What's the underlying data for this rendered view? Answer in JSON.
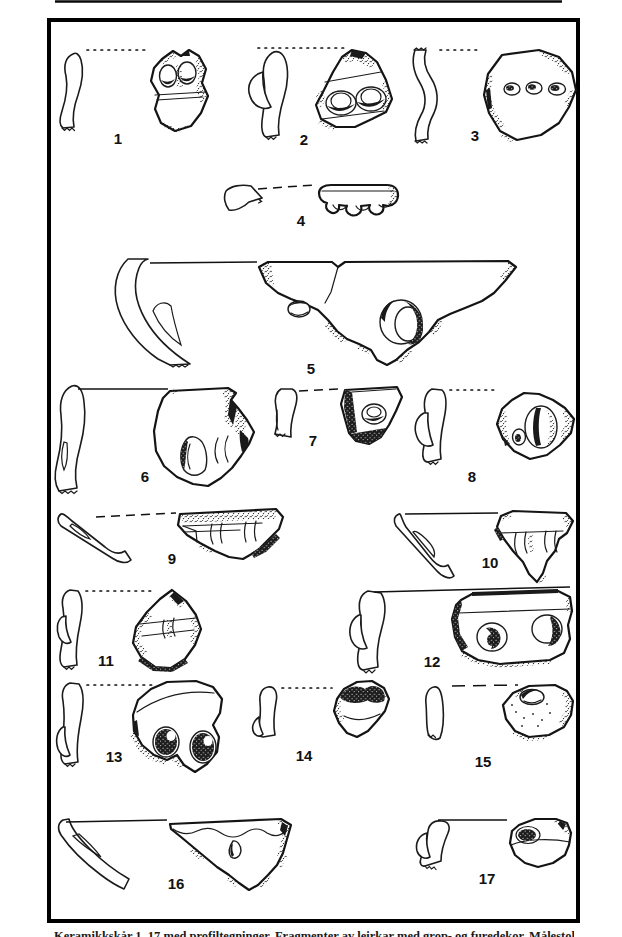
{
  "colors": {
    "paper": "#ffffff",
    "ink": "#1a1a1a",
    "frame": "#000000"
  },
  "plate": {
    "figures": [
      {
        "label": "1",
        "ref_line": "dotted",
        "subject": "body sherd, two oval pit impressions, with profile section"
      },
      {
        "label": "2",
        "ref_line": "dotted",
        "subject": "body sherd, two large oval pits, with bulged profile section"
      },
      {
        "label": "3",
        "ref_line": "dotted",
        "subject": "large body sherd, row of three small pits, with wavy profile section"
      },
      {
        "label": "4",
        "ref_line": "dashed",
        "subject": "rim sherd with three notches on edge, with rim profile"
      },
      {
        "label": "5",
        "ref_line": "solid",
        "subject": "large triangular sherd, one small and one large double pit, with long curved profile"
      },
      {
        "label": "6",
        "ref_line": "solid",
        "subject": "blocky sherd with two vertical grooves, with profile section"
      },
      {
        "label": "7",
        "ref_line": "dashed",
        "subject": "small sherd with single pit, dark crusted edges, with profile section"
      },
      {
        "label": "8",
        "ref_line": "dotted",
        "subject": "rounded sherd with large oval pit and small pit, with bulged profile"
      },
      {
        "label": "9",
        "ref_line": "dashed",
        "subject": "elongated rim sherd with ridges, with slanted profile"
      },
      {
        "label": "10",
        "ref_line": "solid",
        "subject": "trapezoid rim sherd with three vertical bars, with slanted profile"
      },
      {
        "label": "11",
        "ref_line": "dotted",
        "subject": "triangular sherd with horizontal band and groove, with profile section"
      },
      {
        "label": "12",
        "ref_line": "solid",
        "subject": "rectangular sherd with two circular pits, with bulged profile"
      },
      {
        "label": "13",
        "ref_line": "dotted",
        "subject": "rounded sherd with two deep dark pits, with profile section"
      },
      {
        "label": "14",
        "ref_line": "dotted",
        "subject": "small sherd with dark impressions at top, with small profile"
      },
      {
        "label": "15",
        "ref_line": "dashed",
        "subject": "sherd with one oval pit and speckled surface, with small profile"
      },
      {
        "label": "16",
        "ref_line": "solid",
        "subject": "long triangular rim sherd with small perforation, with curved profile"
      },
      {
        "label": "17",
        "ref_line": "solid",
        "subject": "small sherd with dark oval pit and horizontal line, with profile section"
      }
    ]
  },
  "footer": {
    "caption_cropped_text": "Keramikkskår 1–17 med profiltegninger. Fragmenter av leirkar med grop- og furedekor. Målestokk 1:2."
  }
}
